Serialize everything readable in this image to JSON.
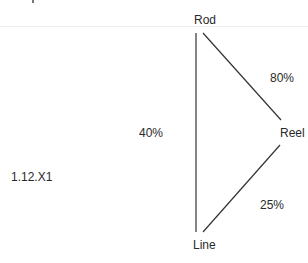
{
  "diagram": {
    "id_label": "1.12.X1",
    "nodes": {
      "rod": "Rod",
      "reel": "Reel",
      "line": "Line"
    },
    "edges": {
      "rod_reel": "80%",
      "rod_line": "40%",
      "reel_line": "25%"
    },
    "colors": {
      "line": "#333333",
      "text": "#2a2a2a",
      "background": "#ffffff"
    }
  }
}
